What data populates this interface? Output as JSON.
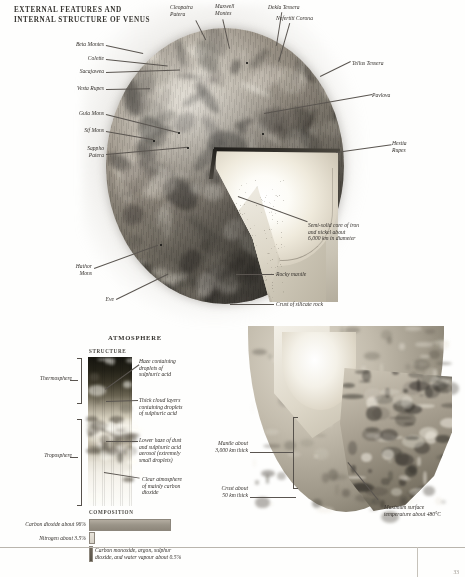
{
  "page": {
    "title": "EXTERNAL FEATURES AND\nINTERNAL STRUCTURE OF VENUS",
    "page_number": "33"
  },
  "main_globe": {
    "caption": "Cutaway globe of Venus showing surface features and internal structure",
    "surface_labels_left": [
      {
        "id": "beta-montes",
        "text": "Beta Montes"
      },
      {
        "id": "colette",
        "text": "Colette"
      },
      {
        "id": "sacajawea",
        "text": "Sacajawea"
      },
      {
        "id": "vesta-rupes",
        "text": "Vesta Rupes"
      },
      {
        "id": "gula-mons",
        "text": "Gula Mons"
      },
      {
        "id": "sif-mons",
        "text": "Sif Mons"
      },
      {
        "id": "sappho-patera",
        "text": "Sappho\nPatera"
      },
      {
        "id": "hathor-mons",
        "text": "Hathor\nMons"
      },
      {
        "id": "eve",
        "text": "Eve"
      }
    ],
    "surface_labels_top": [
      {
        "id": "cleopatra-patera",
        "text": "Cleopatra\nPatera"
      },
      {
        "id": "maxwell-montes",
        "text": "Maxwell\nMontes"
      },
      {
        "id": "dekla-tessera",
        "text": "Dekla Tessera"
      },
      {
        "id": "nefertiti-corona",
        "text": "Nefertiti Corona"
      }
    ],
    "surface_labels_right": [
      {
        "id": "tellus-tessera",
        "text": "Tellus Tessera"
      },
      {
        "id": "pavlova",
        "text": "Pavlova"
      },
      {
        "id": "hestia-rupes",
        "text": "Hestia\nRupes"
      }
    ],
    "interior_labels": [
      {
        "id": "core",
        "text": "Semi-solid core of iron\nand nickel about\n6,000 km in diameter"
      },
      {
        "id": "mantle",
        "text": "Rocky mantle"
      },
      {
        "id": "crust",
        "text": "Crust of silicate rock"
      }
    ],
    "map_names": [
      "ISHTAR TERRA",
      "LAKSHMI PLANUM",
      "ATALANTA PLANITIA",
      "GUINEVERE PLANITIA",
      "NAVKA PLANITIA",
      "ALPHA REGIO",
      "LAVINIA PLANITIA",
      "AINO PLANITIA",
      "EISTLA REGIO"
    ]
  },
  "atmosphere": {
    "heading": "ATMOSPHERE",
    "structure_heading": "STRUCTURE",
    "layers": [
      {
        "id": "thermosphere",
        "text": "Thermosphere"
      },
      {
        "id": "troposphere",
        "text": "Troposphere"
      }
    ],
    "structure_labels": [
      {
        "id": "haze",
        "text": "Haze containing\ndroplets of\nsulphuric acid"
      },
      {
        "id": "cloud-layers",
        "text": "Thick cloud layers\ncontaining droplets\nof sulphuric acid"
      },
      {
        "id": "lower-haze",
        "text": "Lower haze of dust\nand sulphuric acid\naerosol (extremely\nsmall droplets)"
      },
      {
        "id": "clear-atmos",
        "text": "Clear atmosphere\nof mainly carbon\ndioxide"
      }
    ],
    "composition_heading": "COMPOSITION",
    "composition": [
      {
        "id": "carbon-dioxide",
        "text": "Carbon dioxide about 96%",
        "percent": 96.0
      },
      {
        "id": "nitrogen",
        "text": "Nitrogen about 3.5%",
        "percent": 3.5
      },
      {
        "id": "trace-gases",
        "text": "Carbon monoxide, argon, sulphur\ndioxide, and water vapour about 0.5%",
        "percent": 0.5
      }
    ]
  },
  "cutaway_hemisphere": {
    "labels": [
      {
        "id": "mantle-thickness",
        "text": "Mantle about\n3,000 km thick"
      },
      {
        "id": "crust-thickness",
        "text": "Crust about\n50 km thick"
      },
      {
        "id": "max-temperature",
        "text": "Maximum surface\ntemperature about 480°C"
      }
    ]
  },
  "colors": {
    "ink": "#332f2b",
    "rule": "#b9b5ad",
    "co2_bar": "#9a9488",
    "n2_bar": "#ded9d0",
    "trace_bar": "#5f5a4e"
  }
}
